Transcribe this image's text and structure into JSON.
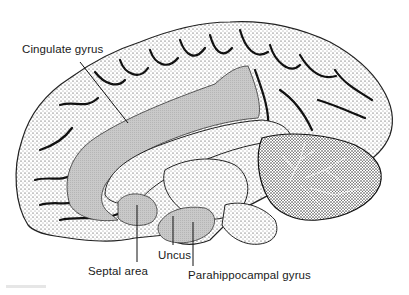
{
  "figure": {
    "shading_color": "#c4c4c4",
    "ink_color": "#111111",
    "background": "#ffffff"
  },
  "labels": [
    {
      "id": "cingulate",
      "text": "Cingulate gyrus"
    },
    {
      "id": "septal",
      "text": "Septal area"
    },
    {
      "id": "uncus",
      "text": "Uncus"
    },
    {
      "id": "parahippocampal",
      "text": "Parahippocampal gyrus"
    }
  ]
}
